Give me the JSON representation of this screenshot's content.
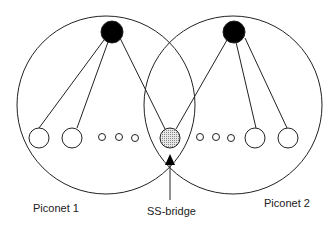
{
  "diagram": {
    "piconets": [
      {
        "label": "Piconet 1"
      },
      {
        "label": "Piconet 2"
      }
    ],
    "bridge": {
      "label": "SS-bridge"
    },
    "colors": {
      "line": "#222222",
      "master": "#000000",
      "bridge_fill": "#d0d0d0"
    }
  }
}
